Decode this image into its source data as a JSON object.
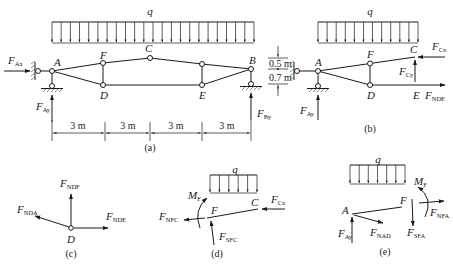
{
  "panels": {
    "a": {
      "caption": "(a)",
      "load_label": "q",
      "load_arrow_count": 23,
      "nodes": {
        "A": "A",
        "B": "B",
        "C": "C",
        "D": "D",
        "E": "E",
        "F": "F"
      },
      "forces": {
        "FAx": {
          "main": "F",
          "sub": "Ax"
        },
        "FAy": {
          "main": "F",
          "sub": "Ay"
        },
        "FBy": {
          "main": "F",
          "sub": "By"
        }
      },
      "dimensions": {
        "spans": [
          "3 m",
          "3 m",
          "3 m",
          "3 m"
        ],
        "heights": [
          "0.5 m",
          "0.7 m"
        ]
      }
    },
    "b": {
      "caption": "(b)",
      "load_label": "q",
      "load_arrow_count": 12,
      "nodes": {
        "A": "A",
        "C": "C",
        "D": "D",
        "E": "E",
        "F": "F"
      },
      "forces": {
        "FAy": {
          "main": "F",
          "sub": "Ay"
        },
        "FCx": {
          "main": "F",
          "sub": "Cx"
        },
        "FCy": {
          "main": "F",
          "sub": "Cy"
        },
        "FNDE": {
          "main": "F",
          "sub": "NDE"
        }
      }
    },
    "c": {
      "caption": "(c)",
      "nodes": {
        "D": "D"
      },
      "forces": {
        "FNDF": {
          "main": "F",
          "sub": "NDF"
        },
        "FNDA": {
          "main": "F",
          "sub": "NDA"
        },
        "FNDE": {
          "main": "F",
          "sub": "NDE"
        }
      }
    },
    "d": {
      "caption": "(d)",
      "load_label": "q",
      "load_arrow_count": 6,
      "nodes": {
        "F": "F",
        "C": "C"
      },
      "forces": {
        "MF": {
          "main": "M",
          "sub": "F"
        },
        "FNFC": {
          "main": "F",
          "sub": "NFC"
        },
        "FSFC": {
          "main": "F",
          "sub": "SFC"
        },
        "FCx": {
          "main": "F",
          "sub": "Cx"
        }
      }
    },
    "e": {
      "caption": "(e)",
      "load_label": "q",
      "load_arrow_count": 7,
      "nodes": {
        "A": "A",
        "F": "F"
      },
      "forces": {
        "MF": {
          "main": "M",
          "sub": "F"
        },
        "FAy": {
          "main": "F",
          "sub": "Ay"
        },
        "FNAD": {
          "main": "F",
          "sub": "NAD"
        },
        "FSFA": {
          "main": "F",
          "sub": "SFA"
        },
        "FNFA": {
          "main": "F",
          "sub": "NFA"
        }
      }
    }
  },
  "colors": {
    "ink": "#1a1a1a",
    "background": "#ffffff"
  }
}
